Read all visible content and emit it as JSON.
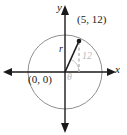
{
  "figure": {
    "type": "coordinate-plane-circle-diagram",
    "background_color": "#ffffff",
    "axes": {
      "x_label": "x",
      "y_label": "y",
      "origin_label": "(0, 0)",
      "axis_color": "#1a1a1a",
      "x_axis": {
        "x_start": 5,
        "x_end": 114,
        "y": 72,
        "arrows": "both"
      },
      "y_axis": {
        "y_start": 8,
        "y_end": 130,
        "x": 65,
        "arrows": "both"
      }
    },
    "circle": {
      "center_x": 65,
      "center_y": 72,
      "radius": 37,
      "stroke_color": "#8f8f8f"
    },
    "point": {
      "label": "(5, 12)",
      "x_value": 5,
      "y_value": 12,
      "pixel_x": 79,
      "pixel_y": 41,
      "marker_color": "#1a1a1a"
    },
    "radius_segment": {
      "label": "r",
      "from": "(0, 0)",
      "to": "(5, 12)",
      "stroke_color": "#1a1a1a"
    },
    "vertical_leg": {
      "label": "12",
      "style": "dashed",
      "stroke_color": "#9a9a9a"
    },
    "angle": {
      "label": "θ",
      "color": "#b9b9b9",
      "arc_color": "#c4c4c4"
    }
  }
}
